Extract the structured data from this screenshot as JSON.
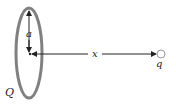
{
  "diagram": {
    "type": "ring-charge-axis",
    "labels": {
      "ring_charge": "Q",
      "radius": "a",
      "distance": "x",
      "point_charge": "q"
    },
    "colors": {
      "ring": "#808080",
      "lines": "#222222",
      "background": "#ffffff"
    }
  }
}
